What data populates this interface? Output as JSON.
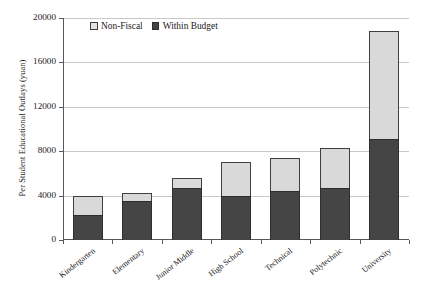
{
  "chart_data": {
    "type": "bar",
    "subtype": "stacked-bar",
    "title": "",
    "xlabel": "",
    "ylabel": "Per Student Educational Outlays (yuan)",
    "ylim": [
      0,
      20000
    ],
    "yticks": [
      0,
      4000,
      8000,
      12000,
      16000,
      20000
    ],
    "ytick_labels": [
      "0",
      "4000",
      "8000",
      "12000",
      "16000",
      "20000"
    ],
    "grid": true,
    "legend_position": "top-left-inside",
    "categories": [
      "Kindergarten",
      "Elementary",
      "Junior Middle",
      "High School",
      "Technical",
      "Polytechnic",
      "University"
    ],
    "series": [
      {
        "name": "Within Budget",
        "color": "#454545",
        "values": [
          2250,
          3550,
          4650,
          3950,
          4450,
          4650,
          9100
        ]
      },
      {
        "name": "Non-Fiscal",
        "color": "#d9d9d9",
        "values": [
          1750,
          650,
          950,
          3100,
          2900,
          3600,
          9700
        ]
      }
    ],
    "totals": [
      4000,
      4200,
      5600,
      7050,
      7350,
      8250,
      18800
    ]
  },
  "legend": {
    "items": [
      {
        "label": "Non-Fiscal",
        "swatch": "nonfiscal"
      },
      {
        "label": "Within Budget",
        "swatch": "within"
      }
    ]
  }
}
